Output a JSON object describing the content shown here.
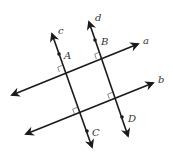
{
  "diagram": {
    "lines": [
      {
        "id": "a",
        "label": "a",
        "x1": 12,
        "y1": 95,
        "x2": 138,
        "y2": 44,
        "label_x": 143,
        "label_y": 44
      },
      {
        "id": "b",
        "label": "b",
        "x1": 26,
        "y1": 134,
        "x2": 153,
        "y2": 83,
        "label_x": 158,
        "label_y": 83
      },
      {
        "id": "c",
        "label": "c",
        "x1": 92,
        "y1": 147,
        "x2": 52,
        "y2": 34,
        "label_x": 58,
        "label_y": 34
      },
      {
        "id": "d",
        "label": "d",
        "x1": 128,
        "y1": 136,
        "x2": 89,
        "y2": 22,
        "label_x": 95,
        "label_y": 21
      }
    ],
    "points": [
      {
        "id": "A",
        "label": "A",
        "x": 59,
        "y": 54,
        "label_x": 64,
        "label_y": 59
      },
      {
        "id": "B",
        "label": "B",
        "x": 95,
        "y": 40,
        "label_x": 101,
        "label_y": 45
      },
      {
        "id": "C",
        "label": "C",
        "x": 87,
        "y": 131,
        "label_x": 92,
        "label_y": 136
      },
      {
        "id": "D",
        "label": "D",
        "x": 122,
        "y": 117,
        "label_x": 128,
        "label_y": 122
      }
    ],
    "right_angles": [
      {
        "at": "c∩a",
        "x": 64,
        "y": 70
      },
      {
        "at": "d∩a",
        "x": 101,
        "y": 57
      },
      {
        "at": "c∩b",
        "x": 79,
        "y": 112
      },
      {
        "at": "d∩b",
        "x": 114,
        "y": 97
      }
    ],
    "colors": {
      "stroke": "#1a1a1a",
      "label": "#333333",
      "background": "#ffffff"
    }
  }
}
